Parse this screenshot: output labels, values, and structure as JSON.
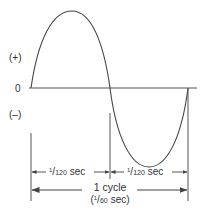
{
  "diagram": {
    "type": "ac-sine-wave-cycle",
    "labels": {
      "positive": "(+)",
      "zero": "0",
      "negative": "(–)"
    },
    "half_cycle_left": {
      "numerator": "1",
      "denominator": "120",
      "unit": "sec"
    },
    "half_cycle_right": {
      "numerator": "1",
      "denominator": "120",
      "unit": "sec"
    },
    "full_cycle": {
      "line1": "1 cycle",
      "open": "(",
      "numerator": "1",
      "denominator": "60",
      "unit": "sec)"
    },
    "colors": {
      "line": "#444444",
      "text": "#333333",
      "background": "#ffffff"
    }
  }
}
